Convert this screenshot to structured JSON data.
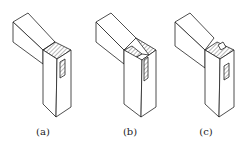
{
  "figure": {
    "panels": [
      {
        "id": "a",
        "label": "(a)",
        "x": 43
      },
      {
        "id": "b",
        "label": "(b)",
        "x": 130
      },
      {
        "id": "c",
        "label": "(c)",
        "x": 206
      }
    ],
    "colors": {
      "line": "#222222",
      "background": "#ffffff"
    }
  }
}
